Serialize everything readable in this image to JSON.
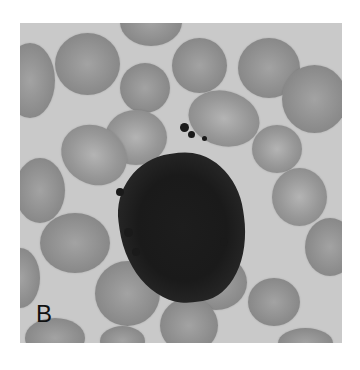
{
  "figure": {
    "panel_label": "B",
    "colors": {
      "background": "#c9c9c9",
      "rbc": "#8e8e8e",
      "cell": "#1d1d1d",
      "label": "#111111"
    }
  }
}
